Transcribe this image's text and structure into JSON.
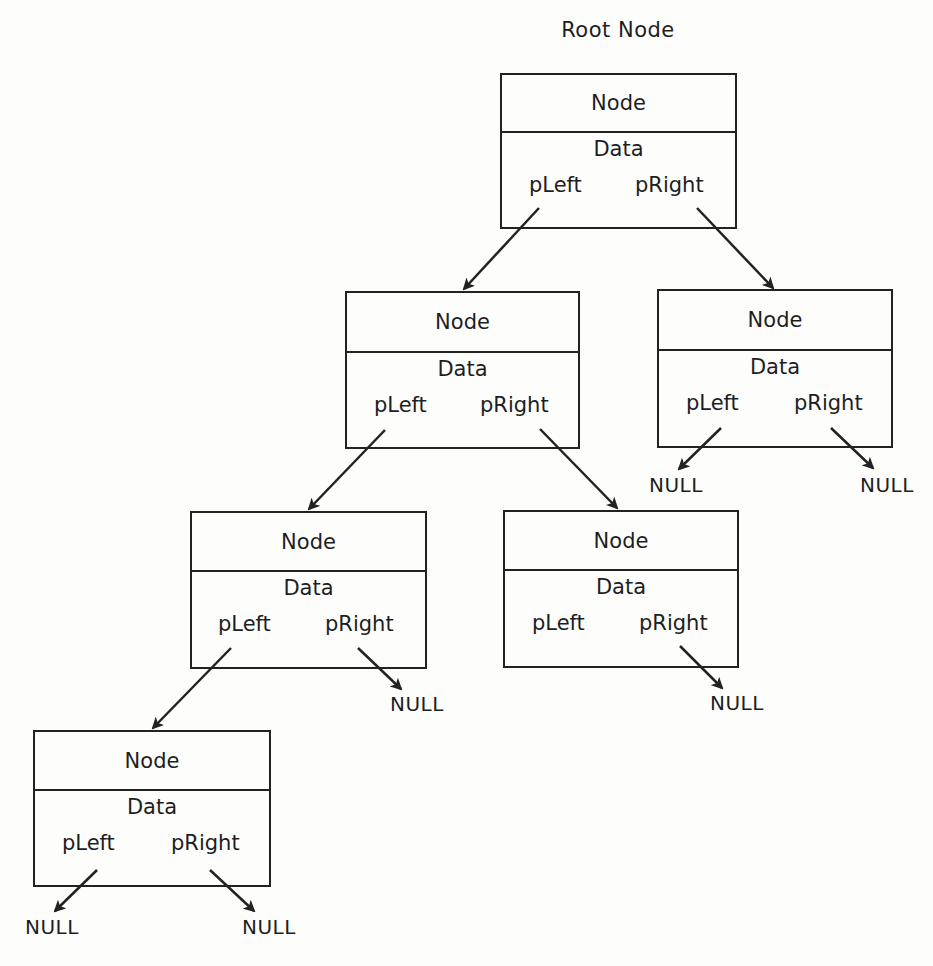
{
  "diagram": {
    "title": "Root Node",
    "labels": {
      "node": "Node",
      "data": "Data",
      "left_ptr": "pLeft",
      "right_ptr": "pRight",
      "null": "NULL"
    },
    "colors": {
      "background": "#fdfdfc",
      "stroke": "#222222",
      "text": "#1e1e1e"
    },
    "nodes": [
      {
        "id": "root",
        "header": "Node",
        "data": "Data",
        "left": "pLeft",
        "right": "pRight"
      },
      {
        "id": "l1-left",
        "header": "Node",
        "data": "Data",
        "left": "pLeft",
        "right": "pRight"
      },
      {
        "id": "l1-right",
        "header": "Node",
        "data": "Data",
        "left": "pLeft",
        "right": "pRight"
      },
      {
        "id": "l2-left",
        "header": "Node",
        "data": "Data",
        "left": "pLeft",
        "right": "pRight"
      },
      {
        "id": "l2-right",
        "header": "Node",
        "data": "Data",
        "left": "pLeft",
        "right": "pRight"
      },
      {
        "id": "l3-left",
        "header": "Node",
        "data": "Data",
        "left": "pLeft",
        "right": "pRight"
      }
    ],
    "edges": [
      {
        "from": "root.pLeft",
        "to": "l1-left"
      },
      {
        "from": "root.pRight",
        "to": "l1-right"
      },
      {
        "from": "l1-left.pLeft",
        "to": "l2-left"
      },
      {
        "from": "l1-left.pRight",
        "to": "l2-right"
      },
      {
        "from": "l1-right.pLeft",
        "to": "NULL"
      },
      {
        "from": "l1-right.pRight",
        "to": "NULL"
      },
      {
        "from": "l2-left.pLeft",
        "to": "l3-left"
      },
      {
        "from": "l2-left.pRight",
        "to": "NULL"
      },
      {
        "from": "l2-right.pRight",
        "to": "NULL"
      },
      {
        "from": "l3-left.pLeft",
        "to": "NULL"
      },
      {
        "from": "l3-left.pRight",
        "to": "NULL"
      }
    ],
    "null_labels": [
      "NULL",
      "NULL",
      "NULL",
      "NULL",
      "NULL",
      "NULL"
    ]
  }
}
